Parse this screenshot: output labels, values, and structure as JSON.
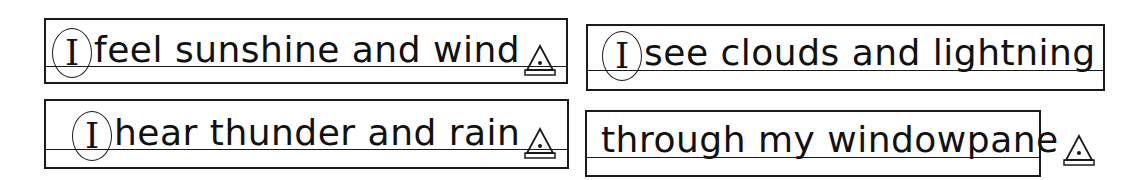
{
  "lines": [
    {
      "pronoun": "I",
      "text": "feel sunshine and wind",
      "end_marker": "triangle-period"
    },
    {
      "pronoun": "I",
      "text": "see clouds and lightning",
      "end_marker": null
    },
    {
      "pronoun": "I",
      "text": "hear thunder and rain",
      "end_marker": "triangle-period"
    },
    {
      "pronoun": null,
      "text": "through my windowpane",
      "end_marker": "triangle-period"
    }
  ],
  "colors": {
    "ink": "#1a1a1a",
    "paper": "#ffffff"
  }
}
